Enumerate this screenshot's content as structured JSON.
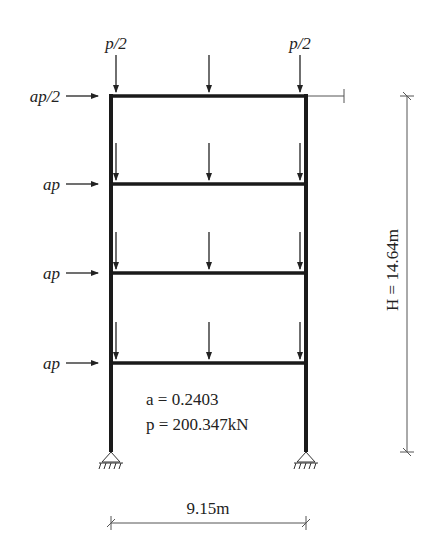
{
  "diagram": {
    "type": "portal-frame-structural-diagram",
    "stories": 4,
    "top_loads": {
      "left": "p/2",
      "right": "p/2"
    },
    "lateral_loads": [
      "ap/2",
      "ap",
      "ap",
      "ap"
    ],
    "parameters": {
      "a_label": "a = 0.2403",
      "p_label": "p = 200.347kN"
    },
    "dimensions": {
      "width": "9.15m",
      "height": "H = 14.64m"
    },
    "colors": {
      "member": "#1a1a1a",
      "dimension": "#555555",
      "text": "#222222"
    }
  }
}
